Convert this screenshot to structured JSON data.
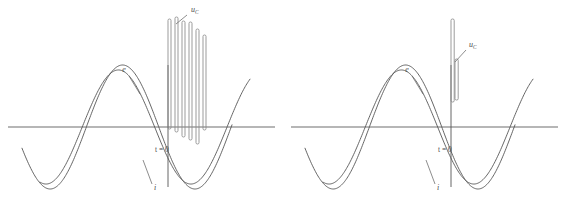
{
  "figure": {
    "type": "waveform-diagram",
    "panel_count": 2,
    "background_color": "#ffffff",
    "curve_color": "#555555",
    "axis_color": "#6e6e6e",
    "pulse_color": "#8a8a8a",
    "label_color": "#4a4a4a"
  },
  "labels": {
    "emf": "e",
    "current": "i",
    "capacitor_voltage_base": "u",
    "capacitor_voltage_sub": "C",
    "time_zero": "t = 0"
  },
  "chart_data": {
    "type": "line",
    "title": "",
    "xlabel": "",
    "ylabel": "",
    "grid": false,
    "legend": "inline-annotations",
    "axis_baseline_y": 0,
    "panels": [
      {
        "name": "left-panel-pulse-train",
        "description": "Sinusoidal emf and current waveforms with a repetitive capacitor-voltage pulse train after the switching instant.",
        "xlim": [
          0,
          283
        ],
        "ylim": [
          -1.25,
          1.55
        ],
        "series": [
          {
            "name": "e",
            "label": "e",
            "kind": "sine",
            "amplitude": 1.0,
            "phase_deg": 200,
            "cycles": 1.45,
            "x_start": 22,
            "x_end": 232,
            "label_x": 124,
            "label_y": 72,
            "leader": [
              [
                129,
                76
              ],
              [
                140,
                94
              ]
            ]
          },
          {
            "name": "i",
            "label": "i",
            "kind": "sine",
            "amplitude": 0.92,
            "phase_deg": 255,
            "cycles": 1.45,
            "x_start": 40,
            "x_end": 250,
            "label_x": 155,
            "label_y": 190,
            "leader": [
              [
                152,
                184
              ],
              [
                143,
                160
              ]
            ]
          }
        ],
        "time_zero_marker": {
          "label": "t = 0",
          "label_x": 155,
          "label_y": 152,
          "x_position": 168
        },
        "pulse_train": {
          "label_base": "u",
          "label_sub": "C",
          "label_x": 191,
          "label_y": 12,
          "leader": [
            [
              187,
              15
            ],
            [
              176,
              24
            ]
          ],
          "pulse_width": 3.0,
          "baseline_y": 127,
          "pulses": [
            {
              "x": 168,
              "top": 19,
              "bottom": 129
            },
            {
              "x": 175,
              "top": 17,
              "bottom": 132
            },
            {
              "x": 182,
              "top": 21,
              "bottom": 137
            },
            {
              "x": 189,
              "top": 22,
              "bottom": 140
            },
            {
              "x": 196,
              "top": 29,
              "bottom": 144
            },
            {
              "x": 203,
              "top": 35,
              "bottom": 130
            }
          ]
        }
      },
      {
        "name": "right-panel-single-pulse",
        "description": "Same sinusoidal emf and current waveforms with a single capacitor-voltage pulse at the switching instant.",
        "xlim": [
          0,
          283
        ],
        "ylim": [
          -1.25,
          1.55
        ],
        "series": [
          {
            "name": "e",
            "label": "e",
            "kind": "sine",
            "amplitude": 1.0,
            "phase_deg": 200,
            "cycles": 1.45,
            "x_start": 22,
            "x_end": 232,
            "label_x": 124,
            "label_y": 72,
            "leader": [
              [
                129,
                76
              ],
              [
                140,
                94
              ]
            ]
          },
          {
            "name": "i",
            "label": "i",
            "kind": "sine",
            "amplitude": 0.92,
            "phase_deg": 255,
            "cycles": 1.45,
            "x_start": 40,
            "x_end": 250,
            "label_x": 155,
            "label_y": 190,
            "leader": [
              [
                152,
                184
              ],
              [
                143,
                160
              ]
            ]
          }
        ],
        "time_zero_marker": {
          "label": "t = 0",
          "label_x": 155,
          "label_y": 152,
          "x_position": 168
        },
        "pulse_train": {
          "label_base": "u",
          "label_sub": "C",
          "label_x": 186,
          "label_y": 47,
          "leader": [
            [
              183,
              50
            ],
            [
              172,
              62
            ]
          ],
          "pulse_width": 3.2,
          "baseline_y": 127,
          "pulses": [
            {
              "x": 168,
              "top": 19,
              "bottom": 102
            },
            {
              "x": 172,
              "top": 59,
              "bottom": 100
            }
          ]
        }
      }
    ]
  }
}
